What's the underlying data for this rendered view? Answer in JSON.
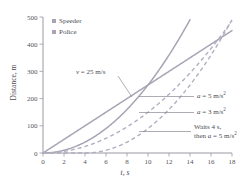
{
  "chart_data": {
    "type": "line",
    "title": "",
    "xlabel": "t, s",
    "ylabel": "Distance, m",
    "xlim": [
      0,
      18
    ],
    "ylim": [
      0,
      500
    ],
    "xticks": [
      0,
      2,
      4,
      6,
      8,
      10,
      12,
      14,
      16,
      18
    ],
    "yticks": [
      0,
      100,
      200,
      300,
      400,
      500
    ],
    "grid": false,
    "legend_position": "top-left",
    "legend": [
      {
        "label": "Speeder",
        "color": "#a9a4b4"
      },
      {
        "label": "Police",
        "color": "#a9a4b4"
      }
    ],
    "series": [
      {
        "name": "Speeder, v = 25 m/s",
        "style": "solid",
        "color": "#a9a4b4",
        "equation": "d = 25 t",
        "x": [
          0,
          2,
          4,
          6,
          8,
          10,
          12,
          14,
          16,
          18
        ],
        "values": [
          0,
          50,
          100,
          150,
          200,
          250,
          300,
          350,
          400,
          450
        ]
      },
      {
        "name": "Police, a = 5 m/s^2",
        "style": "solid",
        "color": "#a9a4b4",
        "equation": "d = 2.5 t^2",
        "x": [
          0,
          2,
          4,
          6,
          8,
          10,
          12,
          14
        ],
        "values": [
          0,
          10,
          40,
          90,
          160,
          250,
          360,
          490
        ]
      },
      {
        "name": "Police, a = 3 m/s^2",
        "style": "dashed",
        "color": "#b3aec0",
        "equation": "d = 1.5 t^2",
        "x": [
          0,
          2,
          4,
          6,
          8,
          10,
          12,
          14,
          16,
          18
        ],
        "values": [
          0,
          6,
          24,
          54,
          96,
          150,
          216,
          294,
          384,
          486
        ]
      },
      {
        "name": "Police, waits 4 s then a = 5 m/s^2",
        "style": "dashed",
        "color": "#b3aec0",
        "equation": "d = 2.5 (t-4)^2 for t >= 4",
        "x": [
          0,
          2,
          4,
          6,
          8,
          10,
          12,
          14,
          16,
          18
        ],
        "values": [
          0,
          0,
          0,
          10,
          40,
          90,
          160,
          250,
          360,
          490
        ]
      }
    ],
    "annotations": [
      {
        "id": "v25",
        "text_parts": {
          "var": "v",
          "rest": " = 25 m/s"
        },
        "text": "v = 25 m/s",
        "points_to_series": "Speeder, v = 25 m/s"
      },
      {
        "id": "a5",
        "text_parts": {
          "var": "a",
          "rest": " = 5 m/s",
          "sup": "2"
        },
        "text": "a = 5 m/s2",
        "points_to_series": "Police, a = 5 m/s^2"
      },
      {
        "id": "a3",
        "text_parts": {
          "var": "a",
          "rest": " = 3 m/s",
          "sup": "2"
        },
        "text": "a = 3 m/s2",
        "points_to_series": "Police, a = 3 m/s^2"
      },
      {
        "id": "wait",
        "line1": "Waits 4 s,",
        "line2_pre": "then ",
        "line2_var": "a",
        "line2_rest": " = 5 m/s",
        "line2_sup": "2",
        "text": "Waits 4 s, then a = 5 m/s2",
        "points_to_series": "Police, waits 4 s then a = 5 m/s^2"
      }
    ]
  },
  "axis": {
    "y_title": "Distance, m",
    "x_title": "t, s",
    "y_tick_labels": [
      "0",
      "100",
      "200",
      "300",
      "400",
      "500"
    ],
    "x_tick_labels": [
      "0",
      "2",
      "4",
      "6",
      "8",
      "10",
      "12",
      "14",
      "16",
      "18"
    ]
  }
}
